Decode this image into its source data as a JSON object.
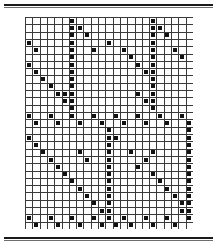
{
  "figure": {
    "title": "",
    "caption": "",
    "frame_color": "#1a1a1a",
    "background_color": "#ffffff"
  },
  "chart_data": {
    "type": "scatter",
    "title": "",
    "subtitle": "",
    "xlabel": "",
    "ylabel": "",
    "xlim": [
      0,
      23
    ],
    "ylim": [
      0,
      29
    ],
    "grid": true,
    "legend_position": "none",
    "n_cols": 23,
    "n_rows": 29,
    "grid_line_color": "#3a3a3a",
    "marker_color": "#111111",
    "marker_shape": "square",
    "marker_size_px": 4,
    "xtick_labels": [],
    "ytick_labels": [],
    "points": [
      [
        6,
        0
      ],
      [
        17,
        0
      ],
      [
        6,
        1
      ],
      [
        7,
        1
      ],
      [
        17,
        1
      ],
      [
        18,
        1
      ],
      [
        6,
        2
      ],
      [
        8,
        2
      ],
      [
        17,
        2
      ],
      [
        19,
        2
      ],
      [
        0,
        3
      ],
      [
        6,
        3
      ],
      [
        11,
        3
      ],
      [
        17,
        3
      ],
      [
        1,
        4
      ],
      [
        6,
        4
      ],
      [
        9,
        4
      ],
      [
        13,
        4
      ],
      [
        17,
        4
      ],
      [
        20,
        4
      ],
      [
        6,
        5
      ],
      [
        14,
        5
      ],
      [
        17,
        5
      ],
      [
        21,
        5
      ],
      [
        0,
        6
      ],
      [
        6,
        6
      ],
      [
        15,
        6
      ],
      [
        17,
        6
      ],
      [
        1,
        7
      ],
      [
        6,
        7
      ],
      [
        16,
        7
      ],
      [
        17,
        7
      ],
      [
        2,
        8
      ],
      [
        6,
        8
      ],
      [
        17,
        8
      ],
      [
        3,
        9
      ],
      [
        6,
        9
      ],
      [
        17,
        9
      ],
      [
        4,
        10
      ],
      [
        5,
        10
      ],
      [
        6,
        10
      ],
      [
        15,
        10
      ],
      [
        17,
        10
      ],
      [
        5,
        11
      ],
      [
        6,
        11
      ],
      [
        16,
        11
      ],
      [
        17,
        11
      ],
      [
        6,
        12
      ],
      [
        17,
        12
      ],
      [
        0,
        13
      ],
      [
        3,
        13
      ],
      [
        6,
        13
      ],
      [
        9,
        13
      ],
      [
        12,
        13
      ],
      [
        15,
        13
      ],
      [
        18,
        13
      ],
      [
        21,
        13
      ],
      [
        1,
        14
      ],
      [
        4,
        14
      ],
      [
        7,
        14
      ],
      [
        10,
        14
      ],
      [
        13,
        14
      ],
      [
        16,
        14
      ],
      [
        19,
        14
      ],
      [
        22,
        14
      ],
      [
        11,
        15
      ],
      [
        22,
        15
      ],
      [
        0,
        16
      ],
      [
        11,
        16
      ],
      [
        12,
        16
      ],
      [
        22,
        16
      ],
      [
        1,
        17
      ],
      [
        11,
        17
      ],
      [
        22,
        17
      ],
      [
        2,
        18
      ],
      [
        7,
        18
      ],
      [
        11,
        18
      ],
      [
        14,
        18
      ],
      [
        17,
        18
      ],
      [
        22,
        18
      ],
      [
        3,
        19
      ],
      [
        8,
        19
      ],
      [
        11,
        19
      ],
      [
        16,
        19
      ],
      [
        22,
        19
      ],
      [
        4,
        20
      ],
      [
        11,
        20
      ],
      [
        15,
        20
      ],
      [
        22,
        20
      ],
      [
        5,
        21
      ],
      [
        11,
        21
      ],
      [
        17,
        21
      ],
      [
        22,
        21
      ],
      [
        6,
        22
      ],
      [
        11,
        22
      ],
      [
        18,
        22
      ],
      [
        22,
        22
      ],
      [
        7,
        23
      ],
      [
        11,
        23
      ],
      [
        19,
        23
      ],
      [
        22,
        23
      ],
      [
        8,
        24
      ],
      [
        11,
        24
      ],
      [
        20,
        24
      ],
      [
        22,
        24
      ],
      [
        9,
        25
      ],
      [
        11,
        25
      ],
      [
        21,
        25
      ],
      [
        22,
        25
      ],
      [
        10,
        26
      ],
      [
        11,
        26
      ],
      [
        21,
        26
      ],
      [
        22,
        26
      ],
      [
        0,
        27
      ],
      [
        3,
        27
      ],
      [
        6,
        27
      ],
      [
        9,
        27
      ],
      [
        11,
        27
      ],
      [
        13,
        27
      ],
      [
        16,
        27
      ],
      [
        19,
        27
      ],
      [
        22,
        27
      ],
      [
        1,
        28
      ],
      [
        4,
        28
      ],
      [
        7,
        28
      ],
      [
        10,
        28
      ],
      [
        12,
        28
      ],
      [
        14,
        28
      ],
      [
        17,
        28
      ],
      [
        20,
        28
      ]
    ]
  }
}
